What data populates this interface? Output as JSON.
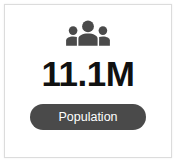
{
  "card": {
    "icon_name": "group-people-icon",
    "icon_color": "#4a4a4a",
    "value": "11.1M",
    "value_color": "#111111",
    "badge": {
      "label": "Population",
      "background_color": "#4a4a4a",
      "text_color": "#ffffff"
    },
    "background_color": "#ffffff",
    "border_color": "#dcdcdc"
  }
}
